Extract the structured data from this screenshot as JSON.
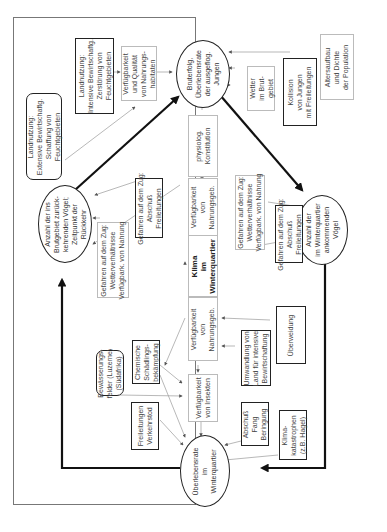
{
  "diagram": {
    "title": "",
    "center": {
      "label": "Klima\nim\nWinterquartier"
    },
    "ellipses": {
      "breeding": {
        "label": "Bruterfolg,\nÜberlebensrate\nder ausgeflog.\nJungen"
      },
      "returning": {
        "label": "Anzahl der ins\nBrutgebiet zurück-\nkehrenden Vögel;\nZeitpunkt der\nRückkehr"
      },
      "arriving": {
        "label": "Anzahl der\nim Winterquartier\nankommenden\nVögel"
      },
      "survival": {
        "label": "Überlebensrate\nim\nWinterquartier"
      }
    },
    "boxes": {
      "land_intensive": {
        "label": "Landnutzung:\nIntensive Bewirtschaftg.\nZerstörung von\nFeuchtgebieten",
        "style": "thick"
      },
      "food_habitats": {
        "label": "Verfügbarkeit\nund Qualität\nvon Nahrungs-\nhabitaten",
        "style": "thin"
      },
      "land_extensive": {
        "label": "Landnutzung:\nExtensive Bewirtschaftg.\nSchaffung von\nFeuchtgebieten",
        "style": "round"
      },
      "physiology": {
        "label": "physiolog.\nKonstitution",
        "style": "thin"
      },
      "weather_breeding": {
        "label": "Wetter\nim Brut-\ngebiet",
        "style": "thin"
      },
      "collision": {
        "label": "Kollision\nvon Jungen\nmit Freileitungen",
        "style": "thick"
      },
      "age_structure": {
        "label": "Altersaufbau\nund Dichte\nder Population",
        "style": "thin"
      },
      "migration_danger_shoot_1": {
        "label": "Gefahren auf dem Zug:\nAbschuß\nFreileitungen",
        "style": "thick"
      },
      "migration_danger_weather_1": {
        "label": "Gefahren auf dem Zug:\nWetterverhältnisse\nVerfügbark. von Nahrung",
        "style": "thin"
      },
      "food_availability_1": {
        "label": "Verfügbarkeit\nvon\nNahrungsgeb.",
        "style": "thin"
      },
      "migration_danger_weather_2": {
        "label": "Gefahren auf dem Zug:\nWetterverhältnisse\nVerfügbark. von Nahrung",
        "style": "thin"
      },
      "migration_danger_shoot_2": {
        "label": "Gefahren auf dem Zug:\nAbschuß\nFreileitungen",
        "style": "thick"
      },
      "irrigation": {
        "label": "Bewässerungs-\nfelder (Luzerne)\n(Südafrika)",
        "style": "round"
      },
      "pesticides": {
        "label": "Chemische\nSchädlings-\nbekämpfung",
        "style": "thick"
      },
      "food_availability_2": {
        "label": "Verfügbarkeit\nvon\nNahrungsgeb.",
        "style": "thin"
      },
      "land_conversion": {
        "label": "Umwandlung von\nLand für intensive\nBewirtschaftung",
        "style": "thick"
      },
      "overgrazing": {
        "label": "Überweidung",
        "style": "thick"
      },
      "power_lines_traffic": {
        "label": "Freileitungen\nVerkehrstod",
        "style": "thick"
      },
      "insects": {
        "label": "Verfügbarkeit\nvon Insekten",
        "style": "thin"
      },
      "hunting": {
        "label": "Abschuß\nFang\nBeringung",
        "style": "thick"
      },
      "climate_catastrophe": {
        "label": "Klima-\nkatastrophen\n(z.B. Hagel)",
        "style": "thick"
      }
    }
  }
}
